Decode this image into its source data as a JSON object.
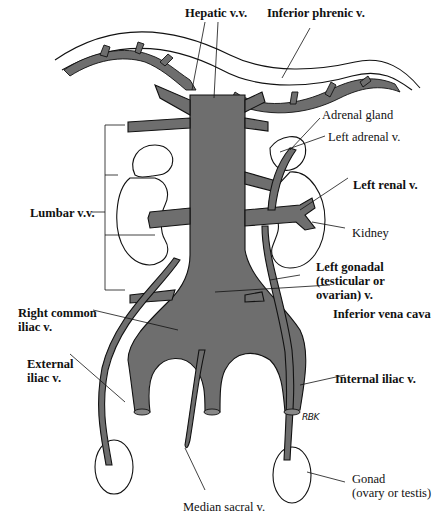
{
  "figure": {
    "colors": {
      "vein_fill": "#6e6e6e",
      "outline": "#111111",
      "background": "#ffffff"
    },
    "labels": {
      "hepatic": "Hepatic v.v.",
      "inferior_phrenic": "Inferior phrenic v.",
      "adrenal_gland": "Adrenal gland",
      "left_adrenal": "Left adrenal v.",
      "lumbar": "Lumbar v.v.",
      "left_renal": "Left renal v.",
      "kidney": "Kidney",
      "left_gonadal": "Left gonadal\n(testicular or\novarian) v.",
      "right_common_iliac": "Right common\niliac v.",
      "inferior_vena_cava": "Inferior vena cava",
      "external_iliac": "External\niliac v.",
      "internal_iliac": "Internal iliac v.",
      "median_sacral": "Median sacral v.",
      "gonad": "Gonad\n(ovary or testis)"
    },
    "signature": "RBK"
  }
}
